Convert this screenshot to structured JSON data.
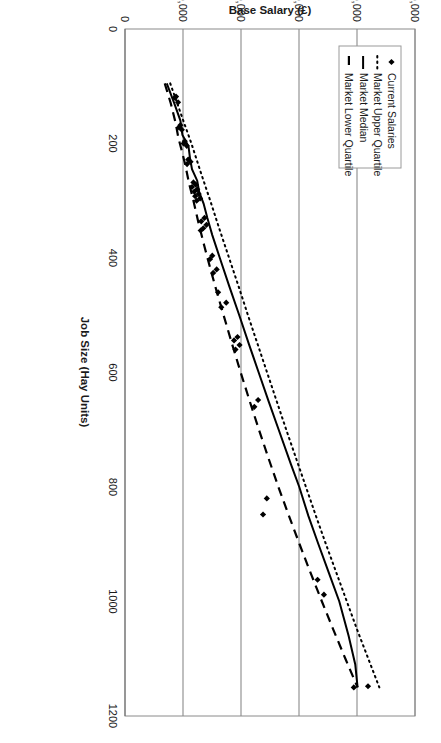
{
  "chart_data": {
    "type": "scatter",
    "title": "",
    "xlabel": "Job Size (Hay Units)",
    "ylabel": "Base Salary (£)",
    "xlim": [
      0,
      1200
    ],
    "ylim": [
      0,
      100000
    ],
    "xticks": [
      0,
      200,
      400,
      600,
      800,
      1000,
      1200
    ],
    "xticklabels": [
      "0",
      "200",
      "400",
      "600",
      "800",
      "1000",
      "1200"
    ],
    "yticks": [
      0,
      20000,
      40000,
      60000,
      80000,
      100000
    ],
    "yticklabels": [
      "0",
      "20,000",
      "40,000",
      "60,000",
      "80,000",
      "100,000"
    ],
    "grid": "y-gridlines-only",
    "legend_position": "top-left-inside",
    "legend": [
      {
        "label": "Current Salaries",
        "marker": "diamond",
        "style": "points"
      },
      {
        "label": "Market Upper Quartile",
        "marker": "none",
        "style": "dotted"
      },
      {
        "label": "Market Median",
        "marker": "none",
        "style": "solid"
      },
      {
        "label": "Market Lower Quartile",
        "marker": "none",
        "style": "dashed"
      }
    ],
    "series": [
      {
        "name": "Current Salaries",
        "style": "points",
        "points": [
          [
            118,
            17600
          ],
          [
            120,
            17200
          ],
          [
            128,
            18300
          ],
          [
            168,
            19100
          ],
          [
            172,
            18600
          ],
          [
            176,
            19600
          ],
          [
            196,
            20600
          ],
          [
            200,
            20200
          ],
          [
            204,
            21300
          ],
          [
            228,
            21800
          ],
          [
            232,
            22600
          ],
          [
            236,
            21400
          ],
          [
            268,
            23600
          ],
          [
            272,
            24400
          ],
          [
            276,
            23100
          ],
          [
            280,
            24900
          ],
          [
            284,
            23900
          ],
          [
            288,
            25400
          ],
          [
            292,
            24200
          ],
          [
            296,
            25900
          ],
          [
            300,
            24700
          ],
          [
            330,
            27400
          ],
          [
            336,
            26300
          ],
          [
            342,
            28100
          ],
          [
            348,
            27000
          ],
          [
            352,
            26100
          ],
          [
            396,
            30100
          ],
          [
            402,
            29300
          ],
          [
            420,
            31600
          ],
          [
            426,
            30400
          ],
          [
            460,
            32100
          ],
          [
            478,
            34900
          ],
          [
            486,
            33200
          ],
          [
            538,
            38800
          ],
          [
            544,
            37600
          ],
          [
            552,
            39500
          ],
          [
            560,
            38100
          ],
          [
            648,
            45900
          ],
          [
            660,
            44600
          ],
          [
            820,
            48900
          ],
          [
            848,
            47600
          ],
          [
            962,
            66400
          ],
          [
            988,
            68600
          ],
          [
            1148,
            83800
          ],
          [
            1150,
            78900
          ]
        ]
      },
      {
        "name": "Market Upper Quartile",
        "style": "dotted",
        "points": [
          [
            95,
            15600
          ],
          [
            150,
            19400
          ],
          [
            200,
            22900
          ],
          [
            250,
            26100
          ],
          [
            300,
            29400
          ],
          [
            350,
            32600
          ],
          [
            400,
            35900
          ],
          [
            450,
            39200
          ],
          [
            500,
            42400
          ],
          [
            550,
            45700
          ],
          [
            600,
            49000
          ],
          [
            650,
            52300
          ],
          [
            700,
            55600
          ],
          [
            750,
            59000
          ],
          [
            800,
            62400
          ],
          [
            850,
            65800
          ],
          [
            900,
            69300
          ],
          [
            950,
            72900
          ],
          [
            1000,
            76500
          ],
          [
            1050,
            80100
          ],
          [
            1100,
            83900
          ],
          [
            1150,
            87700
          ]
        ]
      },
      {
        "name": "Market Median",
        "style": "solid",
        "points": [
          [
            95,
            14400
          ],
          [
            130,
            17000
          ],
          [
            160,
            19100
          ],
          [
            185,
            19800
          ],
          [
            205,
            21900
          ],
          [
            225,
            22400
          ],
          [
            245,
            23100
          ],
          [
            265,
            24900
          ],
          [
            285,
            25600
          ],
          [
            305,
            27100
          ],
          [
            330,
            28400
          ],
          [
            360,
            30100
          ],
          [
            400,
            32700
          ],
          [
            450,
            36000
          ],
          [
            500,
            39400
          ],
          [
            550,
            42700
          ],
          [
            600,
            46100
          ],
          [
            650,
            49500
          ],
          [
            700,
            53000
          ],
          [
            760,
            57200
          ],
          [
            800,
            60100
          ],
          [
            850,
            63200
          ],
          [
            900,
            66700
          ],
          [
            950,
            70300
          ],
          [
            1000,
            73900
          ],
          [
            1060,
            77100
          ],
          [
            1110,
            79400
          ],
          [
            1150,
            80200
          ]
        ]
      },
      {
        "name": "Market Lower Quartile",
        "style": "dashed",
        "points": [
          [
            95,
            13700
          ],
          [
            130,
            15800
          ],
          [
            165,
            17500
          ],
          [
            190,
            18400
          ],
          [
            215,
            19700
          ],
          [
            240,
            20900
          ],
          [
            270,
            22100
          ],
          [
            300,
            23600
          ],
          [
            340,
            25400
          ],
          [
            380,
            27400
          ],
          [
            420,
            29500
          ],
          [
            460,
            31700
          ],
          [
            500,
            34000
          ],
          [
            550,
            36900
          ],
          [
            600,
            39900
          ],
          [
            650,
            43000
          ],
          [
            700,
            46200
          ],
          [
            750,
            49500
          ],
          [
            800,
            52900
          ],
          [
            850,
            56500
          ],
          [
            900,
            60200
          ],
          [
            950,
            64000
          ],
          [
            1000,
            67900
          ],
          [
            1050,
            71900
          ],
          [
            1100,
            76000
          ],
          [
            1150,
            80200
          ]
        ]
      }
    ]
  },
  "colors": {
    "ink": "#000000",
    "frame": "#8a8a8a",
    "grid": "#8a8a8a",
    "background": "#ffffff"
  }
}
